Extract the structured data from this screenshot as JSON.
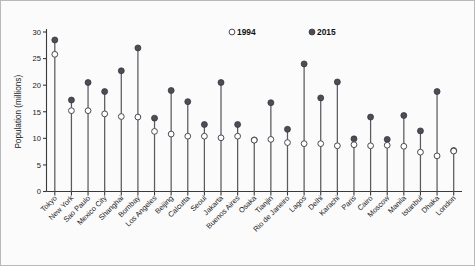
{
  "chart_data": {
    "type": "scatter",
    "title": "",
    "xlabel": "",
    "ylabel": "Population (millions)",
    "ylim": [
      0,
      30
    ],
    "yticks": [
      0,
      5,
      10,
      15,
      20,
      25,
      30
    ],
    "ytick_labels": [
      "0",
      "5",
      "10",
      "15",
      "20",
      "25",
      "30"
    ],
    "grid": false,
    "legend_position": "top-center",
    "marker_style": {
      "1994": "open-circle",
      "2015": "filled-circle"
    },
    "categories": [
      "Tokyo",
      "New York",
      "Sao Paulo",
      "Mexico City",
      "Shanghai",
      "Bombay",
      "Los Angeles",
      "Beijing",
      "Calcutta",
      "Seoul",
      "Jakarta",
      "Buenos Aires",
      "Osaka",
      "Tianjin",
      "Rio de Janeiro",
      "Lagos",
      "Delhi",
      "Karachi",
      "Paris",
      "Cairo",
      "Moscow",
      "Manila",
      "Istanbul",
      "Dhaka",
      "London"
    ],
    "series": [
      {
        "name": "1994",
        "color": "#ffffff",
        "edge_color": "#4a4a52",
        "values": [
          25.8,
          15.2,
          15.2,
          14.6,
          14.1,
          14.0,
          11.3,
          10.8,
          10.4,
          10.4,
          10.1,
          10.4,
          9.65,
          9.8,
          9.2,
          9.0,
          9.0,
          8.6,
          8.8,
          8.6,
          8.7,
          8.5,
          7.4,
          6.7,
          7.6
        ]
      },
      {
        "name": "2015",
        "color": "#4d4d55",
        "edge_color": "#2f2f35",
        "values": [
          28.5,
          17.2,
          20.5,
          18.8,
          22.7,
          27.0,
          13.8,
          19.0,
          16.9,
          12.6,
          20.5,
          12.6,
          9.7,
          16.7,
          11.7,
          24.0,
          17.6,
          20.6,
          9.9,
          14.0,
          9.8,
          14.3,
          11.4,
          18.8,
          7.7
        ]
      }
    ]
  },
  "legend": {
    "items": [
      {
        "label": "1994",
        "marker": "open-circle"
      },
      {
        "label": "2015",
        "marker": "filled-circle"
      }
    ]
  }
}
